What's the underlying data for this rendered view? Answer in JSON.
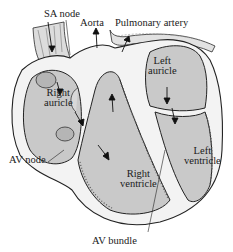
{
  "diagram": {
    "type": "anatomical-illustration",
    "colors": {
      "chamber_fill": "#c9c9c9",
      "wall_fill": "#f2f2f2",
      "outline": "#2a2a2a",
      "text": "#1a1a1a",
      "background": "#ffffff"
    },
    "labels": {
      "sa_node": "SA node",
      "aorta": "Aorta",
      "pulmonary_artery": "Pulmonary artery",
      "left_auricle_1": "Left",
      "left_auricle_2": "auricle",
      "right_auricle_1": "Right",
      "right_auricle_2": "auricle",
      "av_node": "AV node",
      "left_ventricle_1": "Left",
      "left_ventricle_2": "ventricle",
      "right_ventricle_1": "Right",
      "right_ventricle_2": "ventricle",
      "av_bundle": "AV bundle"
    }
  }
}
